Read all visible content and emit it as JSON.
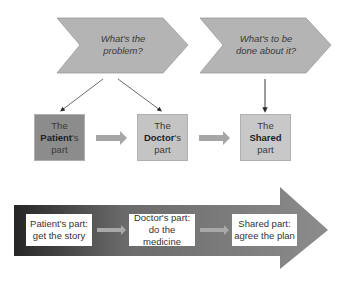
{
  "questions": [
    {
      "line1": "What's the",
      "line2": "problem?"
    },
    {
      "line1": "What's to be",
      "line2": "done about it?"
    }
  ],
  "parts": [
    {
      "prefix": "The",
      "bold": "Patient",
      "suffix": "'s",
      "last": "part",
      "color": "#8c8c8c"
    },
    {
      "prefix": "The",
      "bold": "Doctor",
      "suffix": "'s",
      "last": "part",
      "color": "#c4c4c4"
    },
    {
      "prefix": "The",
      "bold": "Shared",
      "suffix": "",
      "last": "part",
      "color": "#c8c8c8"
    }
  ],
  "flow": [
    {
      "line1": "Patient's part:",
      "line2": "get the story"
    },
    {
      "line1": "Doctor's part:",
      "line2": "do the medicine"
    },
    {
      "line1": "Shared part:",
      "line2": "agree the plan"
    }
  ],
  "colors": {
    "chevron_fill": "#b4b4b4",
    "connector_arrow": "#a6a6a6",
    "flow_dark": "#2a2a2a",
    "flow_light": "#8a8a8a"
  }
}
